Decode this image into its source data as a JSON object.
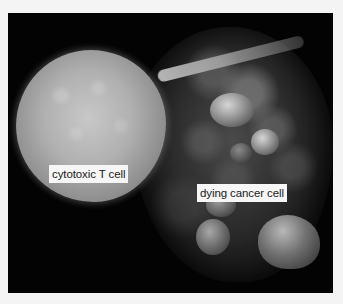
{
  "figure": {
    "labels": {
      "t_cell": "cytotoxic T cell",
      "cancer_cell": "dying cancer cell"
    },
    "colors": {
      "page_background": "#f4f4f4",
      "image_background": "#030303",
      "label_background": "#f6f6f6",
      "label_text": "#1a1a1a"
    }
  }
}
